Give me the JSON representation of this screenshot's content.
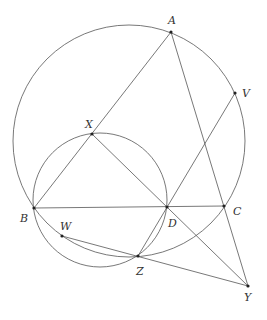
{
  "diagram": {
    "points": [
      {
        "name": "A",
        "x": 171,
        "y": 32,
        "lx": 168,
        "ly": 24,
        "anchor": "start"
      },
      {
        "name": "V",
        "x": 235,
        "y": 93,
        "lx": 242,
        "ly": 97,
        "anchor": "start"
      },
      {
        "name": "X",
        "x": 92,
        "y": 134,
        "lx": 85,
        "ly": 128,
        "anchor": "start"
      },
      {
        "name": "B",
        "x": 34,
        "y": 208,
        "lx": 20,
        "ly": 222,
        "anchor": "start"
      },
      {
        "name": "D",
        "x": 167,
        "y": 207,
        "lx": 168,
        "ly": 227,
        "anchor": "start"
      },
      {
        "name": "C",
        "x": 224,
        "y": 206,
        "lx": 233,
        "ly": 215,
        "anchor": "start"
      },
      {
        "name": "W",
        "x": 62,
        "y": 236,
        "lx": 60,
        "ly": 230,
        "anchor": "start"
      },
      {
        "name": "Z",
        "x": 138,
        "y": 256,
        "lx": 136,
        "ly": 275,
        "anchor": "start"
      },
      {
        "name": "Y",
        "x": 248,
        "y": 286,
        "lx": 244,
        "ly": 301,
        "anchor": "start"
      }
    ],
    "circles": [
      {
        "name": "circumcircle-ABC",
        "cx": 129,
        "cy": 141,
        "r": 116
      },
      {
        "name": "circle-XBD",
        "cx": 100,
        "cy": 200,
        "r": 67
      }
    ],
    "segments": [
      [
        "A",
        "B"
      ],
      [
        "A",
        "Y"
      ],
      [
        "B",
        "C"
      ],
      [
        "X",
        "Y"
      ],
      [
        "V",
        "Z"
      ],
      [
        "W",
        "Y"
      ]
    ]
  }
}
